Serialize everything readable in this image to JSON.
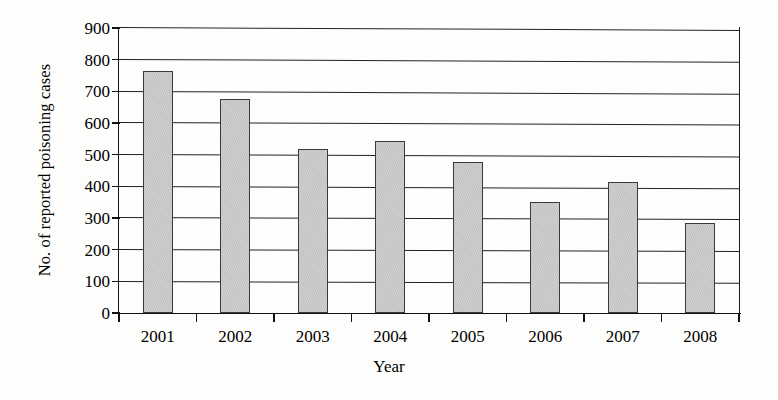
{
  "chart_data": {
    "type": "bar",
    "title": "",
    "xlabel": "Year",
    "ylabel": "No. of reported poisoning cases",
    "categories": [
      "2001",
      "2002",
      "2003",
      "2004",
      "2005",
      "2006",
      "2007",
      "2008"
    ],
    "values": [
      765,
      677,
      517,
      543,
      478,
      350,
      413,
      285
    ],
    "series": [
      {
        "name": "No. of reported poisoning cases",
        "values": [
          765,
          677,
          517,
          543,
          478,
          350,
          413,
          285
        ]
      }
    ],
    "ylim": [
      0,
      900
    ],
    "yticks": [
      0,
      100,
      200,
      300,
      400,
      500,
      600,
      700,
      800,
      900
    ],
    "ytick_labels": [
      "0",
      "100",
      "200",
      "300",
      "400",
      "500",
      "600",
      "700",
      "800",
      "900"
    ],
    "grid": true,
    "grid_axis": "y",
    "legend": false,
    "legend_position": "none",
    "bar_color": "#cccccc",
    "bar_edge_color": "#3a3a3a",
    "axis_color": "#111111"
  }
}
